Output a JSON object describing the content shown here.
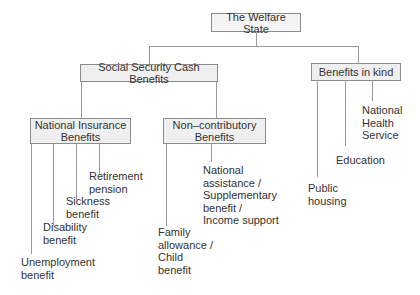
{
  "root": {
    "label": "The Welfare State"
  },
  "level1": [
    {
      "label": "Social Security Cash Benefits"
    },
    {
      "label": "Benefits in kind"
    }
  ],
  "level2": [
    {
      "label": "National Insurance Benefits",
      "lines": [
        "National Insurance",
        "Benefits"
      ]
    },
    {
      "label": "Non-contributory Benefits",
      "lines": [
        "Non–contributory",
        "Benefits"
      ]
    }
  ],
  "national_insurance_leaves": [
    {
      "lines": [
        "Retirement",
        "pension"
      ]
    },
    {
      "lines": [
        "Sickness",
        "benefit"
      ]
    },
    {
      "lines": [
        "Disability",
        "benefit"
      ]
    },
    {
      "lines": [
        "Unemployment",
        "benefit"
      ]
    }
  ],
  "non_contributory_leaves": [
    {
      "lines": [
        "National",
        "assistance /",
        "Supplementary",
        "benefit /",
        "Income support"
      ]
    },
    {
      "lines": [
        "Family",
        "allowance /",
        "Child",
        "benefit"
      ]
    }
  ],
  "benefits_in_kind_leaves": [
    {
      "lines": [
        "National",
        "Health",
        "Service"
      ]
    },
    {
      "lines": [
        "Education"
      ]
    },
    {
      "lines": [
        "Public",
        "housing"
      ]
    }
  ],
  "colors": {
    "box_bg": "#efefef",
    "box_border": "#8c8c8c",
    "line": "#9a9a9a",
    "text": "#333333"
  }
}
